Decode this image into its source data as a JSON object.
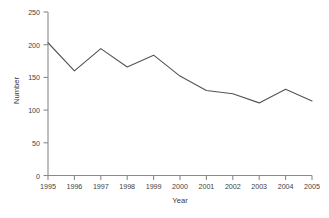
{
  "chart_data": {
    "type": "line",
    "title": "",
    "xlabel": "Year",
    "ylabel": "Number",
    "categories": [
      "1995",
      "1996",
      "1997",
      "1998",
      "1999",
      "2000",
      "2001",
      "2002",
      "2003",
      "2004",
      "2005"
    ],
    "x": [
      1995,
      1996,
      1997,
      1998,
      1999,
      2000,
      2001,
      2002,
      2003,
      2004,
      2005
    ],
    "values": [
      203,
      160,
      194,
      166,
      184,
      152,
      130,
      125,
      111,
      132,
      114
    ],
    "series": [
      {
        "name": "Number",
        "values": [
          203,
          160,
          194,
          166,
          184,
          152,
          130,
          125,
          111,
          132,
          114
        ]
      }
    ],
    "ylim": [
      0,
      250
    ],
    "yticks": [
      0,
      50,
      100,
      150,
      200,
      250
    ],
    "ytick_labels": [
      "0",
      "50",
      "100",
      "150",
      "200",
      "250"
    ],
    "xtick_labels": [
      "1995",
      "1996",
      "1997",
      "1998",
      "1999",
      "2000",
      "2001",
      "2002",
      "2003",
      "2004",
      "2005"
    ],
    "grid": false,
    "legend": false,
    "legend_position": "none",
    "line_color": "#555555",
    "axis_color": "#808080",
    "background_color": "#ffffff"
  },
  "axes": {
    "y_title": "Number",
    "x_title": "Year"
  },
  "title_remnant": "."
}
